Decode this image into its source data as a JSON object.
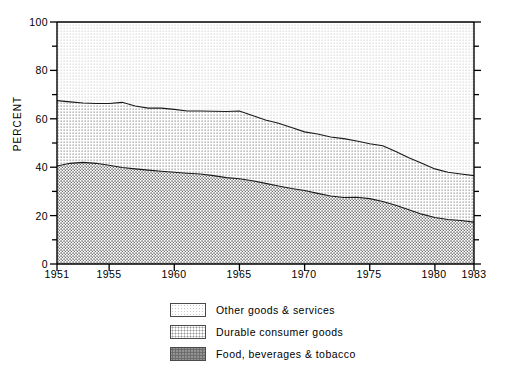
{
  "chart_data": {
    "type": "area",
    "title": "",
    "subtitle": "",
    "xlabel": "",
    "ylabel": "PERCENT",
    "stacked": true,
    "stack_total": 100,
    "grid": false,
    "legend_position": "bottom-center",
    "xlim": [
      1951,
      1983
    ],
    "ylim": [
      0,
      100
    ],
    "y_ticks_major": [
      0,
      20,
      40,
      60,
      80,
      100
    ],
    "y_ticks_minor": [
      10,
      30,
      50,
      70,
      90
    ],
    "y_tick_labels": [
      "0",
      "20",
      "40",
      "60",
      "80",
      "100"
    ],
    "x_ticks": [
      1951,
      1955,
      1960,
      1965,
      1970,
      1975,
      1980,
      1983
    ],
    "x_tick_labels": [
      "1951",
      "1955",
      "1960",
      "1965",
      "1970",
      "1975",
      "1980",
      "1983"
    ],
    "x": [
      1951,
      1952,
      1953,
      1954,
      1955,
      1956,
      1957,
      1958,
      1959,
      1960,
      1961,
      1962,
      1963,
      1964,
      1965,
      1966,
      1967,
      1968,
      1969,
      1970,
      1971,
      1972,
      1973,
      1974,
      1975,
      1976,
      1977,
      1978,
      1979,
      1980,
      1981,
      1982,
      1983
    ],
    "series": [
      {
        "name": "Food, beverages & tobacco",
        "pattern": "dense-dot",
        "stack_order": 1,
        "values": [
          40.5,
          41.6,
          42.0,
          41.6,
          40.8,
          39.9,
          39.3,
          38.8,
          38.3,
          37.9,
          37.5,
          37.2,
          36.5,
          35.7,
          35.2,
          34.4,
          33.3,
          32.2,
          31.2,
          30.4,
          29.2,
          28.1,
          27.5,
          27.6,
          27.0,
          25.8,
          24.3,
          22.4,
          20.6,
          19.2,
          18.4,
          18.0,
          17.3
        ]
      },
      {
        "name": "Durable consumer goods",
        "pattern": "medium-dot",
        "stack_order": 2,
        "values": [
          27.0,
          25.4,
          24.5,
          24.7,
          25.5,
          26.9,
          26.0,
          25.6,
          26.1,
          26.0,
          25.7,
          26.0,
          26.6,
          27.3,
          28.0,
          27.0,
          26.2,
          26.0,
          25.2,
          24.2,
          24.5,
          24.4,
          24.3,
          23.2,
          22.7,
          23.1,
          22.2,
          21.5,
          21.0,
          20.1,
          19.5,
          19.2,
          19.2
        ]
      },
      {
        "name": "Other goods & services",
        "pattern": "light-dot",
        "stack_order": 3,
        "values": [
          32.5,
          33.0,
          33.5,
          33.7,
          33.7,
          33.2,
          34.7,
          35.6,
          35.6,
          36.1,
          36.8,
          36.8,
          36.9,
          37.0,
          36.8,
          38.6,
          40.5,
          41.8,
          43.6,
          45.4,
          46.3,
          47.5,
          48.2,
          49.2,
          50.3,
          51.1,
          53.5,
          56.1,
          58.4,
          60.7,
          62.1,
          62.8,
          63.5
        ]
      }
    ],
    "cumulative_boundaries": {
      "lower_line_label": "top of Food, beverages & tobacco",
      "lower_line": [
        40.5,
        41.6,
        42.0,
        41.6,
        40.8,
        39.9,
        39.3,
        38.8,
        38.3,
        37.9,
        37.5,
        37.2,
        36.5,
        35.7,
        35.2,
        34.4,
        33.3,
        32.2,
        31.2,
        30.4,
        29.2,
        28.1,
        27.5,
        27.6,
        27.0,
        25.8,
        24.3,
        22.4,
        20.6,
        19.2,
        18.4,
        18.0,
        17.3
      ],
      "upper_line_label": "top of Durable consumer goods",
      "upper_line": [
        67.5,
        67.0,
        66.5,
        66.3,
        66.3,
        66.8,
        65.3,
        64.4,
        64.4,
        63.9,
        63.2,
        63.2,
        63.1,
        63.0,
        63.2,
        61.4,
        59.5,
        58.2,
        56.4,
        54.6,
        53.7,
        52.5,
        51.8,
        50.8,
        49.7,
        48.9,
        46.5,
        43.9,
        41.6,
        39.3,
        37.9,
        37.2,
        36.5
      ]
    },
    "legend": [
      {
        "label": "Other goods & services",
        "pattern": "light-dot"
      },
      {
        "label": "Durable consumer goods",
        "pattern": "medium-dot"
      },
      {
        "label": "Food, beverages & tobacco",
        "pattern": "dense-dot"
      }
    ]
  },
  "axes": {
    "y_title": "PERCENT",
    "y_labels": [
      "100",
      "80",
      "60",
      "40",
      "20",
      "0"
    ],
    "x_labels": [
      "1951",
      "1955",
      "1960",
      "1965",
      "1970",
      "1975",
      "1980",
      "1983"
    ]
  },
  "legend": {
    "items": [
      {
        "label": "Other goods & services"
      },
      {
        "label": "Durable consumer goods"
      },
      {
        "label": "Food, beverages & tobacco"
      }
    ]
  },
  "colors": {
    "axis": "#000000",
    "line": "#1a1a1a",
    "band_light": "#c9c9c9",
    "band_medium": "#9a9a9a",
    "band_dense": "#6e6e6e",
    "background": "#ffffff"
  }
}
